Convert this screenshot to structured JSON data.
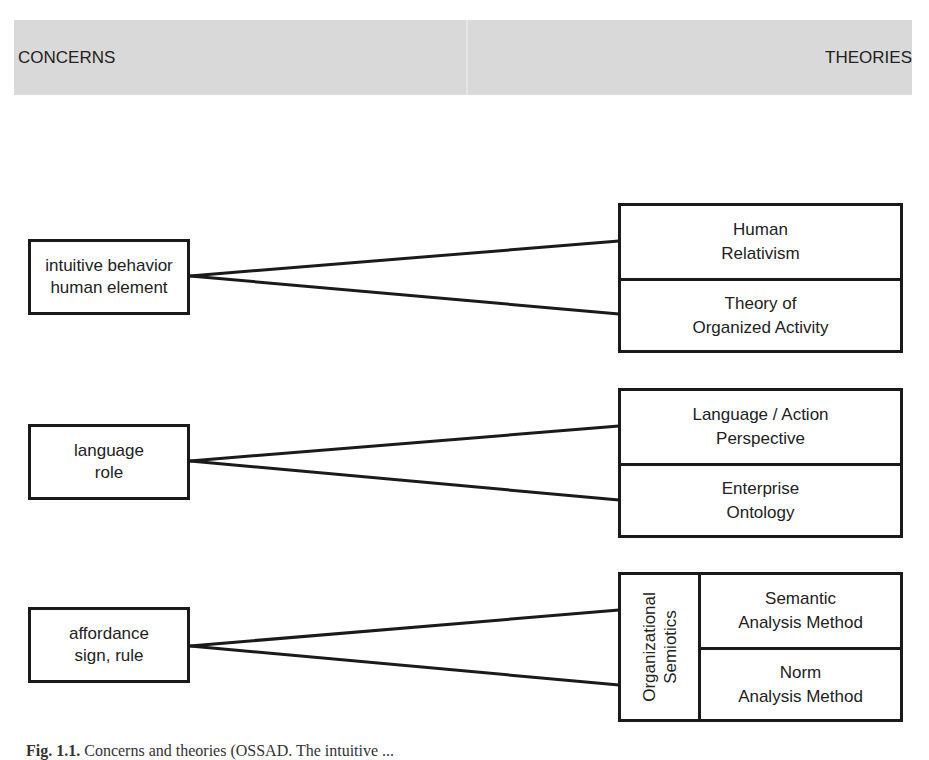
{
  "header": {
    "left_label": "CONCERNS",
    "right_label": "THEORIES",
    "band_color": "#d9d9d9"
  },
  "concerns": [
    {
      "line1": "intuitive behavior",
      "line2": "human element"
    },
    {
      "line1": "language",
      "line2": "role"
    },
    {
      "line1": "affordance",
      "line2": "sign, rule"
    }
  ],
  "theories": [
    {
      "group_label": null,
      "top": {
        "line1": "Human",
        "line2": "Relativism"
      },
      "bottom": {
        "line1": "Theory of",
        "line2": "Organized Activity"
      }
    },
    {
      "group_label": null,
      "top": {
        "line1": "Language / Action",
        "line2": "Perspective"
      },
      "bottom": {
        "line1": "Enterprise",
        "line2": "Ontology"
      }
    },
    {
      "group_label": {
        "line1": "Organizational",
        "line2": "Semiotics"
      },
      "top": {
        "line1": "Semantic",
        "line2": "Analysis Method"
      },
      "bottom": {
        "line1": "Norm",
        "line2": "Analysis Method"
      }
    }
  ],
  "caption": {
    "label": "Fig. 1.1.",
    "text": "Concerns and theories (OSSAD. The intuitive ..."
  }
}
